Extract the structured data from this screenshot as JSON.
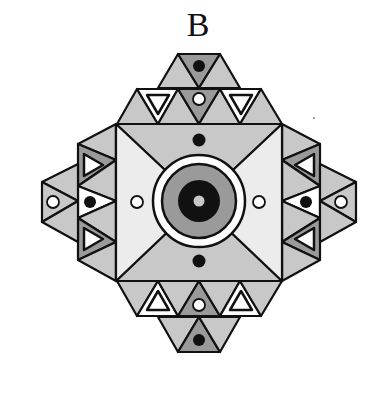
{
  "figure": {
    "label": "B",
    "colors": {
      "outline": "#111111",
      "light_gray": "#c8c8c8",
      "mid_gray": "#9a9a9a",
      "pale": "#ececec",
      "white": "#ffffff",
      "black": "#111111"
    },
    "center_motif": {
      "rings": [
        "white ring",
        "gray ring",
        "black ring",
        "gray center dot"
      ]
    },
    "markers": {
      "top": [
        "black dot (cap)",
        "white dot",
        "inner triangle",
        "inner triangle",
        "black dot (square)"
      ],
      "bottom": [
        "black dot (cap)",
        "white dot",
        "inner triangle",
        "inner triangle",
        "black dot (square)"
      ],
      "left": [
        "white dot (cap)",
        "black dot",
        "inner triangle",
        "inner triangle",
        "white dot (square)"
      ],
      "right": [
        "white dot (cap)",
        "black dot",
        "inner triangle",
        "inner triangle",
        "white dot (square)"
      ]
    }
  }
}
